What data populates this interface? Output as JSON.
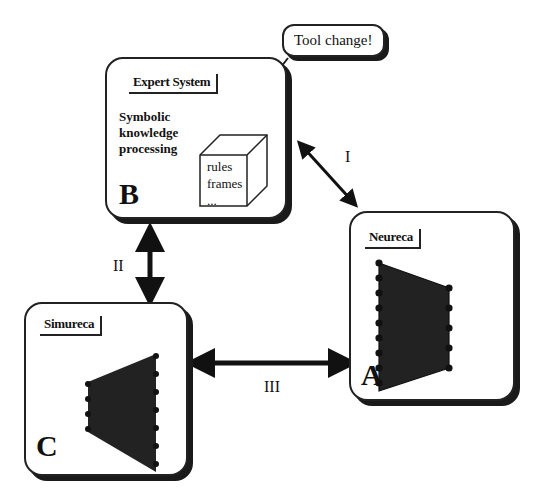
{
  "callout": {
    "text": "Tool change!"
  },
  "boxes": {
    "B": {
      "title": "Expert System",
      "letter": "B",
      "description": [
        "Symbolic",
        "knowledge",
        "processing"
      ],
      "cube_items": [
        "rules",
        "frames",
        "..."
      ]
    },
    "A": {
      "title": "Neureca",
      "letter": "A"
    },
    "C": {
      "title": "Simureca",
      "letter": "C"
    }
  },
  "arrows": {
    "I": {
      "label": "I",
      "from": "B",
      "to": "A"
    },
    "II": {
      "label": "II",
      "from": "B",
      "to": "C"
    },
    "III": {
      "label": "III",
      "from": "C",
      "to": "A"
    }
  }
}
